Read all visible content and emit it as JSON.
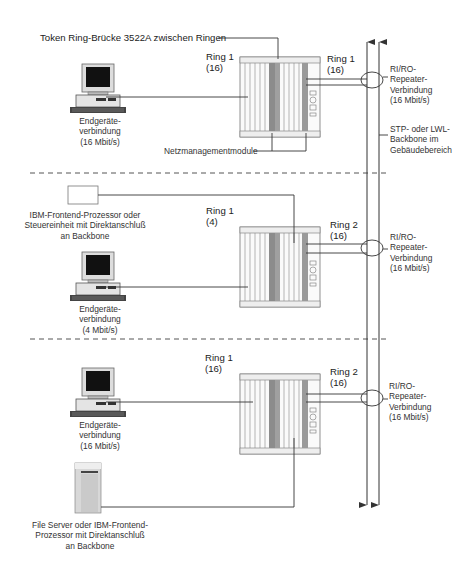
{
  "title": "Token Ring-Brücke 3522A zwischen Ringen",
  "sections": [
    {
      "ring_left": {
        "name": "Ring 1",
        "speed": "(16)"
      },
      "ring_right": {
        "name": "Ring 1",
        "speed": "(16)"
      },
      "workstation": {
        "line1": "Endgeräte-",
        "line2": "verbindung",
        "line3": "(16 Mbit/s)"
      },
      "repeater": {
        "line1": "RI/RO-",
        "line2": "Repeater-",
        "line3": "Verbindung",
        "line4": "(16 Mbit/s)"
      },
      "backbone": {
        "line1": "STP- oder LWL-",
        "line2": "Backbone im",
        "line3": "Gebäudebereich"
      },
      "mgmt": "Netzmanagementmodule"
    },
    {
      "ring_left": {
        "name": "Ring 1",
        "speed": "(4)"
      },
      "ring_right": {
        "name": "Ring 2",
        "speed": "(16)"
      },
      "frontend": {
        "line1": "IBM-Frontend-Prozessor oder",
        "line2": "Steuereinheit mit Direktanschluß",
        "line3": "an Backbone"
      },
      "workstation": {
        "line1": "Endgeräte-",
        "line2": "verbindung",
        "line3": "(4 Mbit/s)"
      },
      "repeater": {
        "line1": "RI/RO-",
        "line2": "Repeater-",
        "line3": "Verbindung",
        "line4": "(16 Mbit/s)"
      }
    },
    {
      "ring_left": {
        "name": "Ring 1",
        "speed": "(16)"
      },
      "ring_right": {
        "name": "Ring 2",
        "speed": "(16)"
      },
      "workstation": {
        "line1": "Endgeräte-",
        "line2": "verbindung",
        "line3": "(16 Mbit/s)"
      },
      "repeater": {
        "line1": "RI/RO-",
        "line2": "Repeater-",
        "line3": "Verbindung",
        "line4": "(16 Mbit/s)"
      },
      "server": {
        "line1": "File Server oder IBM-Frontend-",
        "line2": "Prozessor mit Direktanschluß",
        "line3": "an Backbone"
      }
    }
  ],
  "colors": {
    "line": "#333333",
    "module_dark": "#8c8c8c",
    "module_mid": "#a8a8a8",
    "screen": "#111111",
    "dash": "#555555"
  }
}
